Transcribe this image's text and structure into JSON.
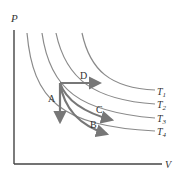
{
  "diagram": {
    "type": "PV diagram with isotherms",
    "axes": {
      "y_label": "P",
      "x_label": "V"
    },
    "isotherms": [
      {
        "name": "T",
        "subscript": "1"
      },
      {
        "name": "T",
        "subscript": "2"
      },
      {
        "name": "T",
        "subscript": "3"
      },
      {
        "name": "T",
        "subscript": "4"
      }
    ],
    "processes": [
      {
        "label": "A",
        "description": "vertical arrow down (constant volume)"
      },
      {
        "label": "B",
        "description": "curved arrow to T4 (steep curve)"
      },
      {
        "label": "C",
        "description": "curved arrow toward T3 (isotherm)"
      },
      {
        "label": "D",
        "description": "horizontal arrow right (constant pressure)"
      }
    ],
    "colors": {
      "axis": "#444444",
      "isotherm": "#8a8a8a",
      "arrow": "#777777",
      "text": "#333333"
    }
  }
}
